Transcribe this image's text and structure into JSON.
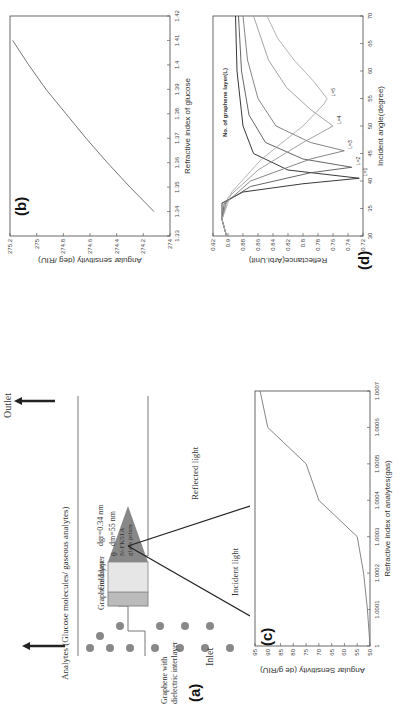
{
  "figure": {
    "panels": {
      "a": {
        "label": "(a)",
        "inlet": "Inlet",
        "outlet": "Outlet",
        "analytes_label": "Analytes (Glucose molecules/ gaseous analytes)",
        "graphene_layer": "Graphene layer",
        "gold_layer": "Gold layer",
        "prism_label_1": "N-FK51A",
        "prism_label_2": "glass prism",
        "theta": "θ",
        "d_gr": "dgr=0.34 nm",
        "d_m": "dm=55 nm",
        "incident_light": "Incident light",
        "reflected_light": "Reflected light",
        "inset_graphene": "Graphene",
        "inset_dielectric": "Dielectric",
        "inset_caption_1": "Graphene with",
        "inset_caption_2": "dielectric interlayer"
      },
      "b": {
        "label": "(b)"
      },
      "c": {
        "label": "(c)"
      },
      "d": {
        "label": "(d)",
        "legend_title": "No. of graphene layer(L)"
      }
    }
  },
  "chart_data": [
    {
      "panel": "b",
      "type": "line",
      "title": "",
      "xlabel": "Refractive index of glucose",
      "ylabel": "Angular sensitivity (deg /RIU)",
      "xlim": [
        1.33,
        1.42
      ],
      "ylim": [
        274,
        275.2
      ],
      "xticks": [
        "1.33",
        "1.34",
        "1.35",
        "1.36",
        "1.37",
        "1.38",
        "1.39",
        "1.4",
        "1.41",
        "1.42"
      ],
      "yticks": [
        "274",
        "274.2",
        "274.4",
        "274.6",
        "274.8",
        "275",
        "275.2"
      ],
      "x": [
        1.34,
        1.35,
        1.36,
        1.37,
        1.38,
        1.39,
        1.4,
        1.41
      ],
      "values": [
        274.12,
        274.3,
        274.47,
        274.63,
        274.78,
        274.93,
        275.06,
        275.18
      ],
      "grid": false
    },
    {
      "panel": "c",
      "type": "line",
      "title": "",
      "xlabel": "Refractive index of analytes(gas)",
      "ylabel": "Angular Sensitivity (de g/RIU)",
      "xlim": [
        1,
        1.0007
      ],
      "ylim": [
        50,
        95
      ],
      "xticks": [
        "1",
        "1.0001",
        "1.0002",
        "1.0003",
        "1.0004",
        "1.0005",
        "1.0006",
        "1.0007"
      ],
      "yticks": [
        "50",
        "55",
        "60",
        "65",
        "70",
        "75",
        "80",
        "85",
        "90",
        "95"
      ],
      "x": [
        1,
        1.0001,
        1.0002,
        1.0003,
        1.0004,
        1.0005,
        1.0006,
        1.0007
      ],
      "values": [
        50,
        51,
        52.5,
        55,
        70,
        75,
        90,
        93
      ],
      "grid": false
    },
    {
      "panel": "d",
      "type": "line",
      "title": "",
      "xlabel": "Incident angle(degree)",
      "ylabel": "Reflectance(Arbi.Unit)",
      "xlim": [
        30,
        70
      ],
      "ylim": [
        0.72,
        0.92
      ],
      "xticks": [
        "30",
        "35",
        "40",
        "45",
        "50",
        "55",
        "60",
        "65",
        "70"
      ],
      "yticks": [
        "0.72",
        "0.74",
        "0.76",
        "0.78",
        "0.8",
        "0.82",
        "0.84",
        "0.86",
        "0.88",
        "0.9",
        "0.92"
      ],
      "legend_title": "No. of graphene layer(L)",
      "series": [
        {
          "name": "L=1",
          "x": [
            30,
            33,
            36,
            38,
            39.5,
            40.5,
            42,
            45,
            50,
            60,
            70
          ],
          "values": [
            0.902,
            0.908,
            0.908,
            0.88,
            0.8,
            0.725,
            0.82,
            0.866,
            0.88,
            0.888,
            0.89
          ]
        },
        {
          "name": "L=2",
          "x": [
            30,
            33,
            36,
            39,
            41.5,
            42.5,
            44,
            47,
            52,
            60,
            70
          ],
          "values": [
            0.902,
            0.908,
            0.905,
            0.87,
            0.79,
            0.735,
            0.8,
            0.85,
            0.872,
            0.882,
            0.886
          ]
        },
        {
          "name": "L=3",
          "x": [
            30,
            33,
            36,
            40,
            44,
            45.5,
            47,
            50,
            55,
            62,
            70
          ],
          "values": [
            0.902,
            0.908,
            0.903,
            0.87,
            0.79,
            0.745,
            0.79,
            0.836,
            0.86,
            0.874,
            0.88
          ]
        },
        {
          "name": "L=4",
          "x": [
            30,
            33,
            37,
            42,
            47,
            50,
            53,
            57,
            62,
            70
          ],
          "values": [
            0.902,
            0.908,
            0.9,
            0.86,
            0.8,
            0.76,
            0.79,
            0.822,
            0.846,
            0.866
          ]
        },
        {
          "name": "L=5",
          "x": [
            30,
            33,
            38,
            44,
            50,
            54,
            55,
            58,
            62,
            66,
            70
          ],
          "values": [
            0.902,
            0.908,
            0.895,
            0.855,
            0.8,
            0.772,
            0.768,
            0.785,
            0.812,
            0.834,
            0.848
          ]
        }
      ],
      "grid": false
    }
  ],
  "caption": "Fig. — (a) Schematic of the graphene-based SPR sensor for glucose and gaseous analytes detection; (b) angular sensitivity vs. refractive index of glucose; (c) angular sensitivity vs. refractive index of gas; (d) reflectance vs. incident angle for different numbers of graphene layers"
}
